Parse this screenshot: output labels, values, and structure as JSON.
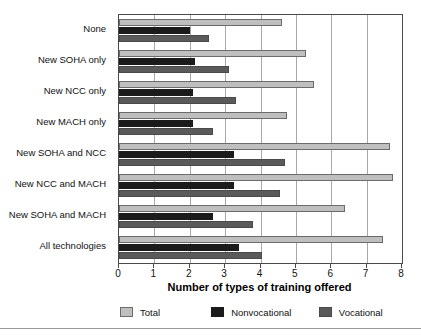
{
  "chart_data": {
    "type": "bar",
    "orientation": "horizontal",
    "title": "",
    "xlabel": "Number of types of training offered",
    "ylabel": "",
    "xlim": [
      0,
      8
    ],
    "xticks": [
      0,
      1,
      2,
      3,
      4,
      5,
      6,
      7,
      8
    ],
    "grid": true,
    "legend_position": "bottom",
    "categories": [
      "None",
      "New SOHA only",
      "New NCC only",
      "New MACH only",
      "New SOHA and NCC",
      "New NCC and MACH",
      "New SOHA and MACH",
      "All technologies"
    ],
    "series": [
      {
        "name": "Total",
        "color": "#bfbfbf",
        "values": [
          4.6,
          5.3,
          5.5,
          4.75,
          7.65,
          7.75,
          6.4,
          7.45
        ]
      },
      {
        "name": "Nonvocational",
        "color": "#1b1b1b",
        "values": [
          2.0,
          2.15,
          2.1,
          2.1,
          3.25,
          3.25,
          2.65,
          3.4
        ]
      },
      {
        "name": "Vocational",
        "color": "#5a5a5a",
        "values": [
          2.55,
          3.1,
          3.3,
          2.65,
          4.7,
          4.55,
          3.8,
          4.05
        ]
      }
    ]
  },
  "axis": {
    "tick_labels": [
      "0",
      "1",
      "2",
      "3",
      "4",
      "5",
      "6",
      "7",
      "8"
    ],
    "title": "Number of types of training offered"
  },
  "legend": {
    "items": [
      {
        "label": "Total",
        "color": "#bfbfbf"
      },
      {
        "label": "Nonvocational",
        "color": "#1b1b1b"
      },
      {
        "label": "Vocational",
        "color": "#5a5a5a"
      }
    ]
  }
}
